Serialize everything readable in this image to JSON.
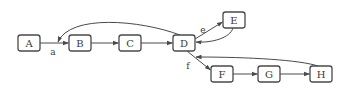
{
  "diagram": {
    "type": "directed-graph",
    "nodes": [
      {
        "id": "A",
        "label": "A",
        "x": 18,
        "y": 35,
        "w": 22,
        "h": 16
      },
      {
        "id": "B",
        "label": "B",
        "x": 69,
        "y": 35,
        "w": 22,
        "h": 16
      },
      {
        "id": "C",
        "label": "C",
        "x": 119,
        "y": 35,
        "w": 22,
        "h": 16
      },
      {
        "id": "D",
        "label": "D",
        "x": 173,
        "y": 35,
        "w": 22,
        "h": 16
      },
      {
        "id": "E",
        "label": "E",
        "x": 223,
        "y": 12,
        "w": 22,
        "h": 16
      },
      {
        "id": "F",
        "label": "F",
        "x": 211,
        "y": 66,
        "w": 22,
        "h": 16
      },
      {
        "id": "G",
        "label": "G",
        "x": 258,
        "y": 66,
        "w": 22,
        "h": 16
      },
      {
        "id": "H",
        "label": "H",
        "x": 310,
        "y": 66,
        "w": 22,
        "h": 16
      }
    ],
    "edges": [
      {
        "from": "A",
        "to": "B",
        "label": "a"
      },
      {
        "from": "B",
        "to": "C",
        "label": ""
      },
      {
        "from": "C",
        "to": "D",
        "label": ""
      },
      {
        "from": "D",
        "to": "A-B edge",
        "label": ""
      },
      {
        "from": "D",
        "to": "E",
        "label": "e"
      },
      {
        "from": "E",
        "to": "D",
        "label": ""
      },
      {
        "from": "D",
        "to": "F",
        "label": "f"
      },
      {
        "from": "F",
        "to": "G",
        "label": ""
      },
      {
        "from": "G",
        "to": "H",
        "label": ""
      },
      {
        "from": "H",
        "to": "D",
        "label": ""
      }
    ],
    "edge_labels": {
      "a": "a",
      "e": "e",
      "f": "f"
    }
  }
}
